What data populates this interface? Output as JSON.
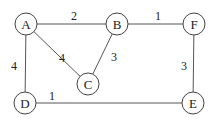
{
  "graph": {
    "nodes": [
      {
        "id": "A",
        "label": "A",
        "x": 26,
        "y": 24
      },
      {
        "id": "B",
        "label": "B",
        "x": 117,
        "y": 24
      },
      {
        "id": "F",
        "label": "F",
        "x": 194,
        "y": 24
      },
      {
        "id": "C",
        "label": "C",
        "x": 88,
        "y": 84
      },
      {
        "id": "D",
        "label": "D",
        "x": 25,
        "y": 103
      },
      {
        "id": "E",
        "label": "E",
        "x": 193,
        "y": 103
      }
    ],
    "edges": [
      {
        "from": "A",
        "to": "B",
        "weight": "2",
        "lx": 74,
        "ly": 16
      },
      {
        "from": "B",
        "to": "F",
        "weight": "1",
        "lx": 158,
        "ly": 16
      },
      {
        "from": "A",
        "to": "C",
        "weight": "4",
        "lx": 62,
        "ly": 58
      },
      {
        "from": "B",
        "to": "C",
        "weight": "3",
        "lx": 114,
        "ly": 57
      },
      {
        "from": "A",
        "to": "D",
        "weight": "4",
        "lx": 14,
        "ly": 66
      },
      {
        "from": "D",
        "to": "E",
        "weight": "1",
        "lx": 52,
        "ly": 96
      },
      {
        "from": "F",
        "to": "E",
        "weight": "3",
        "lx": 184,
        "ly": 66
      }
    ],
    "node_radius": 11
  }
}
